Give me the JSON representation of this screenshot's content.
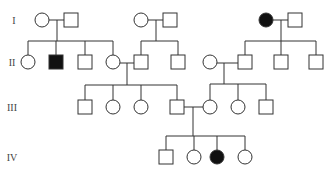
{
  "diagram": {
    "type": "pedigree",
    "colors": {
      "line": "#333333",
      "affected": "#111111",
      "unaffected": "#ffffff"
    },
    "generation_labels": [
      {
        "id": "I",
        "label": "I",
        "x": 14,
        "y": 20
      },
      {
        "id": "II",
        "label": "II",
        "x": 12,
        "y": 62
      },
      {
        "id": "III",
        "label": "III",
        "x": 12,
        "y": 107
      },
      {
        "id": "IV",
        "label": "IV",
        "x": 12,
        "y": 157
      }
    ],
    "individuals": [
      {
        "id": "I-1",
        "sex": "female",
        "affected": false,
        "x": 42,
        "y": 20
      },
      {
        "id": "I-2",
        "sex": "male",
        "affected": false,
        "x": 71,
        "y": 20
      },
      {
        "id": "I-3",
        "sex": "female",
        "affected": false,
        "x": 141,
        "y": 20
      },
      {
        "id": "I-4",
        "sex": "male",
        "affected": false,
        "x": 170,
        "y": 20
      },
      {
        "id": "I-5",
        "sex": "female",
        "affected": true,
        "x": 266,
        "y": 20
      },
      {
        "id": "I-6",
        "sex": "male",
        "affected": false,
        "x": 295,
        "y": 20
      },
      {
        "id": "II-1",
        "sex": "female",
        "affected": false,
        "x": 28,
        "y": 62
      },
      {
        "id": "II-2",
        "sex": "male",
        "affected": true,
        "x": 56,
        "y": 62
      },
      {
        "id": "II-3",
        "sex": "male",
        "affected": false,
        "x": 85,
        "y": 62
      },
      {
        "id": "II-4",
        "sex": "female",
        "affected": false,
        "x": 113,
        "y": 62
      },
      {
        "id": "II-5",
        "sex": "male",
        "affected": false,
        "x": 141,
        "y": 62
      },
      {
        "id": "II-6",
        "sex": "male",
        "affected": false,
        "x": 178,
        "y": 62
      },
      {
        "id": "II-7",
        "sex": "female",
        "affected": false,
        "x": 210,
        "y": 62
      },
      {
        "id": "II-8",
        "sex": "male",
        "affected": false,
        "x": 245,
        "y": 62
      },
      {
        "id": "II-9",
        "sex": "male",
        "affected": false,
        "x": 281,
        "y": 62
      },
      {
        "id": "II-10",
        "sex": "male",
        "affected": false,
        "x": 316,
        "y": 62
      },
      {
        "id": "III-1",
        "sex": "male",
        "affected": false,
        "x": 85,
        "y": 107
      },
      {
        "id": "III-2",
        "sex": "female",
        "affected": false,
        "x": 113,
        "y": 107
      },
      {
        "id": "III-3",
        "sex": "female",
        "affected": false,
        "x": 141,
        "y": 107
      },
      {
        "id": "III-4",
        "sex": "male",
        "affected": false,
        "x": 177,
        "y": 107
      },
      {
        "id": "III-5",
        "sex": "female",
        "affected": false,
        "x": 210,
        "y": 107
      },
      {
        "id": "III-6",
        "sex": "female",
        "affected": false,
        "x": 238,
        "y": 107
      },
      {
        "id": "III-7",
        "sex": "male",
        "affected": false,
        "x": 266,
        "y": 107
      },
      {
        "id": "IV-1",
        "sex": "male",
        "affected": false,
        "x": 166,
        "y": 157
      },
      {
        "id": "IV-2",
        "sex": "female",
        "affected": false,
        "x": 194,
        "y": 157
      },
      {
        "id": "IV-3",
        "sex": "female",
        "affected": true,
        "x": 217,
        "y": 157
      },
      {
        "id": "IV-4",
        "sex": "female",
        "affected": false,
        "x": 245,
        "y": 157
      }
    ],
    "lines": [
      {
        "name": "marriage-I1-I2",
        "x1": 49,
        "y1": 20,
        "x2": 64,
        "y2": 20
      },
      {
        "name": "descent-I1-I2",
        "x1": 57,
        "y1": 20,
        "x2": 57,
        "y2": 41
      },
      {
        "name": "sibship-II-1to4",
        "x1": 28,
        "y1": 41,
        "x2": 113,
        "y2": 41
      },
      {
        "name": "drop-II-1",
        "x1": 28,
        "y1": 41,
        "x2": 28,
        "y2": 55
      },
      {
        "name": "drop-II-2",
        "x1": 56,
        "y1": 41,
        "x2": 56,
        "y2": 55
      },
      {
        "name": "drop-II-3",
        "x1": 85,
        "y1": 41,
        "x2": 85,
        "y2": 55
      },
      {
        "name": "drop-II-4",
        "x1": 113,
        "y1": 41,
        "x2": 113,
        "y2": 55
      },
      {
        "name": "marriage-I3-I4",
        "x1": 148,
        "y1": 20,
        "x2": 163,
        "y2": 20
      },
      {
        "name": "descent-I3-I4",
        "x1": 156,
        "y1": 20,
        "x2": 156,
        "y2": 41
      },
      {
        "name": "sibship-II-5to6",
        "x1": 141,
        "y1": 41,
        "x2": 178,
        "y2": 41
      },
      {
        "name": "drop-II-5",
        "x1": 141,
        "y1": 41,
        "x2": 141,
        "y2": 55
      },
      {
        "name": "drop-II-6",
        "x1": 178,
        "y1": 41,
        "x2": 178,
        "y2": 55
      },
      {
        "name": "marriage-I5-I6",
        "x1": 273,
        "y1": 20,
        "x2": 288,
        "y2": 20
      },
      {
        "name": "descent-I5-I6",
        "x1": 281,
        "y1": 20,
        "x2": 281,
        "y2": 41
      },
      {
        "name": "sibship-II-8to10",
        "x1": 245,
        "y1": 41,
        "x2": 316,
        "y2": 41
      },
      {
        "name": "drop-II-8",
        "x1": 245,
        "y1": 41,
        "x2": 245,
        "y2": 55
      },
      {
        "name": "drop-II-9",
        "x1": 281,
        "y1": 41,
        "x2": 281,
        "y2": 55
      },
      {
        "name": "drop-II-10",
        "x1": 316,
        "y1": 41,
        "x2": 316,
        "y2": 55
      },
      {
        "name": "marriage-II4-II5",
        "x1": 120,
        "y1": 63,
        "x2": 134,
        "y2": 63
      },
      {
        "name": "descent-II4-II5",
        "x1": 127,
        "y1": 63,
        "x2": 127,
        "y2": 85
      },
      {
        "name": "sibship-III-1to4",
        "x1": 85,
        "y1": 85,
        "x2": 177,
        "y2": 85
      },
      {
        "name": "drop-III-1",
        "x1": 85,
        "y1": 85,
        "x2": 85,
        "y2": 100
      },
      {
        "name": "drop-III-2",
        "x1": 113,
        "y1": 85,
        "x2": 113,
        "y2": 100
      },
      {
        "name": "drop-III-3",
        "x1": 141,
        "y1": 85,
        "x2": 141,
        "y2": 100
      },
      {
        "name": "drop-III-4",
        "x1": 177,
        "y1": 85,
        "x2": 177,
        "y2": 100
      },
      {
        "name": "marriage-II7-II8",
        "x1": 217,
        "y1": 63,
        "x2": 238,
        "y2": 63
      },
      {
        "name": "descent-II7-II8",
        "x1": 224,
        "y1": 63,
        "x2": 224,
        "y2": 84
      },
      {
        "name": "sibship-III-5to7",
        "x1": 210,
        "y1": 84,
        "x2": 266,
        "y2": 84
      },
      {
        "name": "drop-III-5",
        "x1": 210,
        "y1": 84,
        "x2": 210,
        "y2": 100
      },
      {
        "name": "drop-III-6",
        "x1": 238,
        "y1": 84,
        "x2": 238,
        "y2": 100
      },
      {
        "name": "drop-III-7",
        "x1": 266,
        "y1": 84,
        "x2": 266,
        "y2": 100
      },
      {
        "name": "marriage-III4-III5",
        "x1": 184,
        "y1": 107,
        "x2": 203,
        "y2": 107
      },
      {
        "name": "descent-III4-III5",
        "x1": 193,
        "y1": 107,
        "x2": 193,
        "y2": 136
      },
      {
        "name": "sibship-IV-1to4",
        "x1": 166,
        "y1": 136,
        "x2": 245,
        "y2": 136
      },
      {
        "name": "drop-IV-1",
        "x1": 166,
        "y1": 136,
        "x2": 166,
        "y2": 150
      },
      {
        "name": "drop-IV-2",
        "x1": 194,
        "y1": 136,
        "x2": 194,
        "y2": 150
      },
      {
        "name": "drop-IV-3",
        "x1": 217,
        "y1": 136,
        "x2": 217,
        "y2": 150
      },
      {
        "name": "drop-IV-4",
        "x1": 245,
        "y1": 136,
        "x2": 245,
        "y2": 150
      }
    ]
  }
}
